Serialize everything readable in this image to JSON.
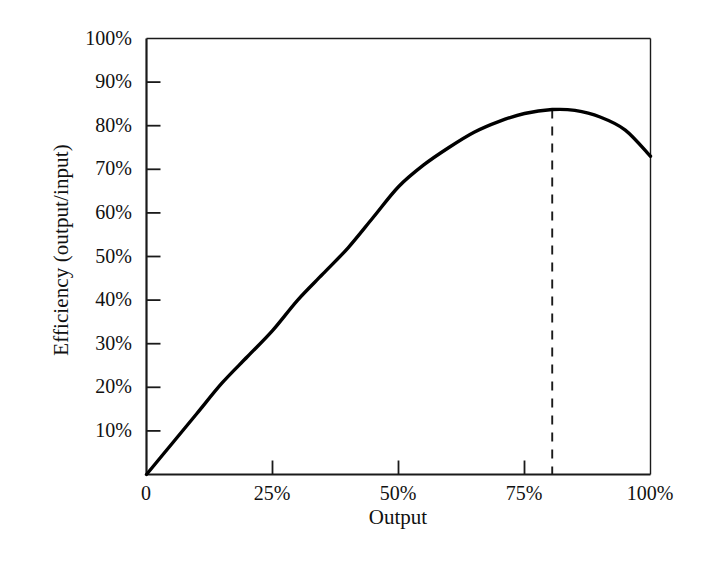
{
  "chart_data": {
    "type": "line",
    "title": "",
    "xlabel": "Output",
    "ylabel": "Efficiency (output/input)",
    "xlim": [
      0,
      100
    ],
    "ylim": [
      0,
      100
    ],
    "grid": false,
    "legend": null,
    "x_tick_labels": [
      "0",
      "25%",
      "50%",
      "75%",
      "100%"
    ],
    "x_tick_values": [
      0,
      25,
      50,
      75,
      100
    ],
    "y_tick_labels": [
      "10%",
      "20%",
      "30%",
      "40%",
      "50%",
      "60%",
      "70%",
      "80%",
      "90%",
      "100%"
    ],
    "y_tick_values": [
      10,
      20,
      30,
      40,
      50,
      60,
      70,
      80,
      90,
      100
    ],
    "series": [
      {
        "name": "Efficiency curve",
        "x": [
          0,
          5,
          10,
          15,
          20,
          25,
          30,
          35,
          40,
          45,
          50,
          55,
          60,
          65,
          70,
          75,
          80.5,
          85,
          90,
          95,
          100
        ],
        "y": [
          0,
          7,
          14,
          21,
          27,
          33,
          40,
          46,
          52,
          59,
          66,
          71,
          75,
          78.5,
          81,
          82.8,
          83.7,
          83.5,
          82,
          79,
          73
        ]
      }
    ],
    "annotations": [
      {
        "name": "peak-marker",
        "type": "dashed-vertical-line",
        "x": 80.5,
        "y_from": 0,
        "y_to": 83.7,
        "label": ""
      }
    ],
    "colors": {
      "background": "#ffffff",
      "axis": "#1a1a1a",
      "curve": "#000000",
      "dashed": "#1a1a1a",
      "text": "#111111"
    }
  },
  "axes": {
    "y_ticks": [
      {
        "label": "100%"
      },
      {
        "label": "90%"
      },
      {
        "label": "80%"
      },
      {
        "label": "70%"
      },
      {
        "label": "60%"
      },
      {
        "label": "50%"
      },
      {
        "label": "40%"
      },
      {
        "label": "30%"
      },
      {
        "label": "20%"
      },
      {
        "label": "10%"
      }
    ],
    "x_ticks": [
      {
        "label": "0"
      },
      {
        "label": "25%"
      },
      {
        "label": "50%"
      },
      {
        "label": "75%"
      },
      {
        "label": "100%"
      }
    ],
    "y_title": "Efficiency (output/input)",
    "x_title": "Output"
  }
}
